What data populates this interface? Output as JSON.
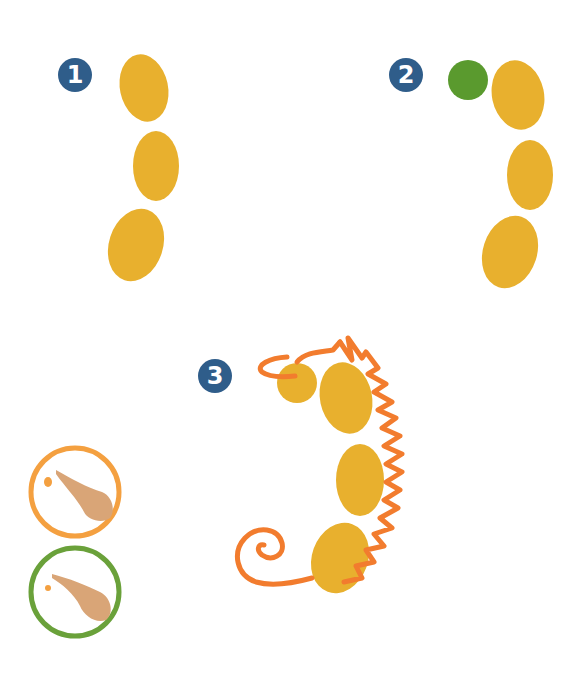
{
  "steps": [
    {
      "number": "1",
      "description": "three yellow fingerprints in a curve"
    },
    {
      "number": "2",
      "description": "green dot added at top"
    },
    {
      "number": "3",
      "description": "orange outline drawn as seahorse"
    }
  ],
  "hints": [
    {
      "name": "orange-finger-hint",
      "ring_color": "#f4a040"
    },
    {
      "name": "green-finger-hint",
      "ring_color": "#6aa13a"
    }
  ],
  "colors": {
    "badge": "#2f5d8a",
    "fingerprint": "#e8b02e",
    "green_dot": "#5a9a2e",
    "orange_line": "#f27c2e"
  }
}
